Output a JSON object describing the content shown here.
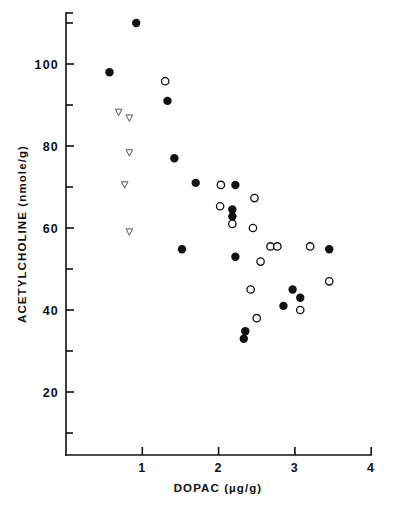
{
  "figure": {
    "background_color": "#ffffff",
    "ink_color": "#111111"
  },
  "chart_data": {
    "type": "scatter",
    "title": "",
    "xlabel": "DOPAC (µg/g)",
    "ylabel": "ACETYLCHOLINE (nmole/g)",
    "xlim": [
      0,
      4
    ],
    "ylim": [
      0,
      112
    ],
    "grid": false,
    "legend_position": "none",
    "x_ticks_major": [
      1,
      2,
      3,
      4
    ],
    "x_tick_labels": [
      "1",
      "2",
      "3",
      "4"
    ],
    "y_ticks_major": [
      20,
      40,
      60,
      80,
      100
    ],
    "y_tick_labels": [
      "20",
      "40",
      "60",
      "80",
      "100"
    ],
    "y_ticks_minor": [
      10,
      30,
      50,
      70,
      90,
      110
    ],
    "series": [
      {
        "name": "filled-circle",
        "marker": "filled-circle",
        "color": "#111111",
        "points": [
          [
            0.92,
            110.0
          ],
          [
            0.57,
            98.0
          ],
          [
            1.33,
            91.0
          ],
          [
            1.42,
            77.0
          ],
          [
            1.7,
            71.0
          ],
          [
            2.22,
            70.5
          ],
          [
            2.18,
            64.5
          ],
          [
            2.18,
            62.8
          ],
          [
            1.52,
            54.8
          ],
          [
            2.22,
            53.0
          ],
          [
            3.45,
            54.8
          ],
          [
            2.97,
            45.0
          ],
          [
            3.07,
            43.0
          ],
          [
            2.85,
            41.0
          ],
          [
            2.35,
            34.8
          ],
          [
            2.33,
            33.0
          ]
        ]
      },
      {
        "name": "open-circle",
        "marker": "open-circle",
        "color": "#111111",
        "points": [
          [
            1.3,
            95.8
          ],
          [
            2.03,
            70.5
          ],
          [
            2.47,
            67.3
          ],
          [
            2.02,
            65.3
          ],
          [
            2.18,
            61.0
          ],
          [
            2.45,
            60.0
          ],
          [
            2.68,
            55.5
          ],
          [
            2.77,
            55.5
          ],
          [
            3.2,
            55.5
          ],
          [
            2.55,
            51.8
          ],
          [
            3.45,
            47.0
          ],
          [
            2.42,
            45.0
          ],
          [
            3.07,
            40.0
          ],
          [
            2.5,
            38.0
          ]
        ]
      },
      {
        "name": "open-triangle-down",
        "marker": "open-triangle-down",
        "color": "#555555",
        "points": [
          [
            0.69,
            88.2
          ],
          [
            0.83,
            86.8
          ],
          [
            0.83,
            78.3
          ],
          [
            0.77,
            70.5
          ],
          [
            0.83,
            59.0
          ]
        ]
      }
    ]
  }
}
